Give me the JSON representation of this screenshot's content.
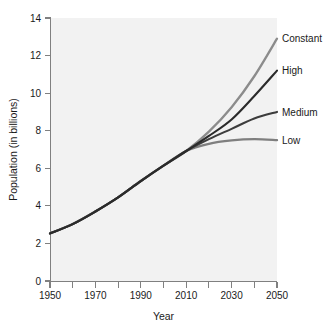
{
  "chart_data": {
    "type": "line",
    "title": "",
    "subtitle": "",
    "xlabel": "Year",
    "ylabel": "Population (in billions)",
    "xlim": [
      1950,
      2050
    ],
    "ylim": [
      0,
      14
    ],
    "xticks": [
      1950,
      1970,
      1990,
      2010,
      2030,
      2050
    ],
    "xticklabels": [
      "1950",
      "1970",
      "1990",
      "2010",
      "2030",
      "2050"
    ],
    "xminorticks": [
      1960,
      1980,
      2000,
      2020,
      2040
    ],
    "yticks": [
      0,
      2,
      4,
      6,
      8,
      10,
      12,
      14
    ],
    "yticklabels": [
      "0",
      "2",
      "4",
      "6",
      "8",
      "10",
      "12",
      "14"
    ],
    "grid": false,
    "legend_position": "right-of-line-ends",
    "x": [
      1950,
      1960,
      1970,
      1980,
      1990,
      2000,
      2010,
      2020,
      2030,
      2040,
      2050
    ],
    "series": [
      {
        "name": "Constant",
        "color": "#8c8c8c",
        "linewidth": 2.3,
        "values": [
          2.53,
          3.03,
          3.7,
          4.45,
          5.32,
          6.14,
          6.92,
          7.95,
          9.25,
          10.9,
          12.9
        ]
      },
      {
        "name": "High",
        "color": "#2b2b2b",
        "linewidth": 2.1,
        "values": [
          2.53,
          3.03,
          3.7,
          4.45,
          5.32,
          6.14,
          6.92,
          7.72,
          8.6,
          9.85,
          11.2
        ]
      },
      {
        "name": "Medium",
        "color": "#3d3d3d",
        "linewidth": 2.1,
        "values": [
          2.53,
          3.03,
          3.7,
          4.45,
          5.32,
          6.14,
          6.92,
          7.55,
          8.1,
          8.65,
          9.0
        ]
      },
      {
        "name": "Low",
        "color": "#7f7f7f",
        "linewidth": 2.3,
        "values": [
          2.53,
          3.03,
          3.7,
          4.45,
          5.32,
          6.14,
          6.92,
          7.3,
          7.48,
          7.55,
          7.5
        ]
      }
    ],
    "legend_entries": [
      {
        "label": "Constant",
        "color": "#8c8c8c",
        "at_value": 12.9
      },
      {
        "label": "High",
        "color": "#2b2b2b",
        "at_value": 11.2
      },
      {
        "label": "Medium",
        "color": "#3d3d3d",
        "at_value": 9.0
      },
      {
        "label": "Low",
        "color": "#7f7f7f",
        "at_value": 7.5
      }
    ],
    "colors": {
      "plot_background": "#f2f2f2",
      "page_background": "#ffffff",
      "axis": "#808080",
      "text": "#1a1a1a"
    }
  }
}
